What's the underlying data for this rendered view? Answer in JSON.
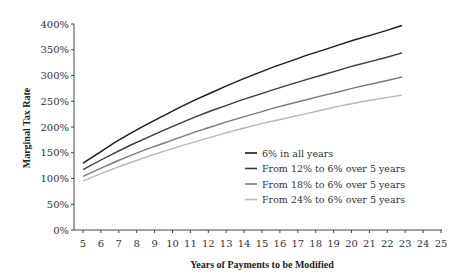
{
  "chart_data": {
    "type": "line",
    "title": "",
    "xlabel": "Years of Payments to be Modified",
    "ylabel": "Marginal Tax Rate",
    "xlim": [
      5,
      25
    ],
    "ylim": [
      0,
      400
    ],
    "x": [
      5,
      6,
      7,
      8,
      9,
      10,
      11,
      12,
      13,
      14,
      15,
      16,
      17,
      18,
      19,
      20,
      21,
      22,
      23,
      24,
      25
    ],
    "x_tick_labels": [
      "5",
      "6",
      "7",
      "8",
      "9",
      "10",
      "11",
      "12",
      "13",
      "14",
      "15",
      "16",
      "17",
      "18",
      "19",
      "20",
      "21",
      "22",
      "23",
      "24",
      "25"
    ],
    "y_ticks": [
      0,
      50,
      100,
      150,
      200,
      250,
      300,
      350,
      400
    ],
    "y_tick_labels": [
      "0%",
      "50%",
      "100%",
      "150%",
      "200%",
      "250%",
      "300%",
      "350%",
      "400%"
    ],
    "grid": false,
    "legend_position": "inside lower right",
    "series": [
      {
        "name": "6% in all years",
        "color": "#1a1a1a",
        "values": [
          130,
          150,
          170,
          188,
          205,
          221,
          237,
          252,
          266,
          280,
          293,
          305,
          317,
          328,
          339,
          349,
          359,
          369,
          378,
          387,
          397
        ]
      },
      {
        "name": "From 12% to 6% over 5 years",
        "color": "#3a3a3a",
        "values": [
          117,
          134,
          150,
          165,
          179,
          193,
          206,
          219,
          231,
          242,
          253,
          263,
          273,
          283,
          292,
          301,
          310,
          319,
          327,
          335,
          344
        ]
      },
      {
        "name": "From 18% to 6% over 5 years",
        "color": "#7a7a7a",
        "values": [
          104,
          118,
          132,
          145,
          157,
          168,
          179,
          190,
          200,
          210,
          219,
          228,
          237,
          245,
          253,
          261,
          268,
          276,
          283,
          290,
          297
        ]
      },
      {
        "name": "From 24% to 6% over 5 years",
        "color": "#b8b8b8",
        "values": [
          95,
          108,
          120,
          131,
          142,
          152,
          162,
          171,
          180,
          189,
          197,
          205,
          212,
          219,
          226,
          233,
          240,
          246,
          252,
          257,
          262
        ]
      }
    ]
  }
}
